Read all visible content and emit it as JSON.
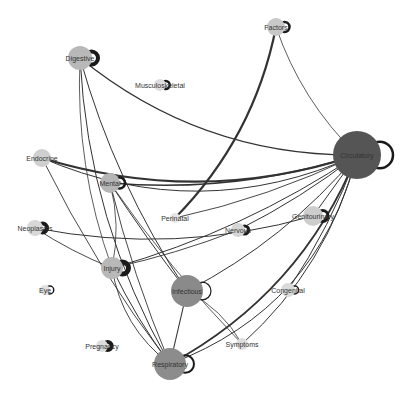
{
  "diagram": {
    "type": "network-graph",
    "colors": {
      "node_light": "#d3d3d3",
      "node_medium": "#b8b8b8",
      "node_large": "#8c8c8c",
      "node_hub": "#555555",
      "edge": "#333333",
      "label": "#333333"
    },
    "nodes": [
      {
        "id": "digestive",
        "label": "Digestive",
        "x": 80,
        "y": 58,
        "r": 12,
        "fill": "#b8b8b8",
        "loop": 4
      },
      {
        "id": "factors",
        "label": "Factors",
        "x": 276,
        "y": 27,
        "r": 9,
        "fill": "#c8c8c8",
        "loop": 2.5
      },
      {
        "id": "musculoskeletal",
        "label": "Musculoskeletal",
        "x": 160,
        "y": 85,
        "r": 6,
        "fill": "#dddddd",
        "loop": 2.5
      },
      {
        "id": "circulatory",
        "label": "Circulatory",
        "x": 357,
        "y": 155,
        "r": 24,
        "fill": "#555555",
        "loop": 2.5
      },
      {
        "id": "endocrine",
        "label": "Endocrine",
        "x": 42,
        "y": 158,
        "r": 9,
        "fill": "#cfcfcf",
        "loop": 0
      },
      {
        "id": "mental",
        "label": "Mental",
        "x": 110,
        "y": 183,
        "r": 10,
        "fill": "#b5b5b5",
        "loop": 2.5
      },
      {
        "id": "perinatal",
        "label": "Perinatal",
        "x": 175,
        "y": 218,
        "r": 5,
        "fill": "#e6e6e6",
        "loop": 0
      },
      {
        "id": "neoplasms",
        "label": "Neoplasms",
        "x": 35,
        "y": 228,
        "r": 8,
        "fill": "#d8d8d8",
        "loop": 4
      },
      {
        "id": "nervous",
        "label": "Nervous",
        "x": 238,
        "y": 230,
        "r": 7,
        "fill": "#d5d5d5",
        "loop": 3
      },
      {
        "id": "genitourinary",
        "label": "Genitourinary",
        "x": 313,
        "y": 216,
        "r": 10,
        "fill": "#cdcdcd",
        "loop": 3
      },
      {
        "id": "injury",
        "label": "Injury",
        "x": 112,
        "y": 268,
        "r": 11,
        "fill": "#b8b8b8",
        "loop": 5
      },
      {
        "id": "infectious",
        "label": "Infectious",
        "x": 187,
        "y": 291,
        "r": 16,
        "fill": "#8a8a8a",
        "loop": 1.2
      },
      {
        "id": "eye",
        "label": "Eye",
        "x": 45,
        "y": 290,
        "r": 5,
        "fill": "#e0e0e0",
        "loop": 1.5
      },
      {
        "id": "congenital",
        "label": "Congenital",
        "x": 288,
        "y": 290,
        "r": 7,
        "fill": "#dadada",
        "loop": 1.5
      },
      {
        "id": "pregnancy",
        "label": "Pregnancy",
        "x": 102,
        "y": 346,
        "r": 6,
        "fill": "#dcdcdc",
        "loop": 4
      },
      {
        "id": "respiratory",
        "label": "Respiratory",
        "x": 170,
        "y": 364,
        "r": 16,
        "fill": "#8c8c8c",
        "loop": 2
      },
      {
        "id": "symptoms",
        "label": "Symptoms",
        "x": 242,
        "y": 344,
        "r": 6,
        "fill": "#dddddd",
        "loop": 0
      }
    ],
    "edges": [
      {
        "source": "digestive",
        "target": "circulatory",
        "w": 1.2,
        "bend": 0.18
      },
      {
        "source": "digestive",
        "target": "respiratory",
        "w": 1.0,
        "bend": 0.12
      },
      {
        "source": "digestive",
        "target": "infectious",
        "w": 1.0,
        "bend": 0.08
      },
      {
        "source": "digestive",
        "target": "injury",
        "w": 0.8,
        "bend": 0.1
      },
      {
        "source": "factors",
        "target": "perinatal",
        "w": 2.2,
        "bend": -0.15
      },
      {
        "source": "factors",
        "target": "circulatory",
        "w": 0.8,
        "bend": 0.12
      },
      {
        "source": "endocrine",
        "target": "circulatory",
        "w": 2.2,
        "bend": 0.16
      },
      {
        "source": "endocrine",
        "target": "circulatory",
        "w": 1.0,
        "bend": 0.22
      },
      {
        "source": "endocrine",
        "target": "respiratory",
        "w": 0.9,
        "bend": 0.05
      },
      {
        "source": "mental",
        "target": "circulatory",
        "w": 1.6,
        "bend": 0.1
      },
      {
        "source": "mental",
        "target": "infectious",
        "w": 1.0,
        "bend": 0.02
      },
      {
        "source": "mental",
        "target": "respiratory",
        "w": 0.9,
        "bend": 0.04
      },
      {
        "source": "mental",
        "target": "symptoms",
        "w": 0.8,
        "bend": 0.04
      },
      {
        "source": "mental",
        "target": "injury",
        "w": 0.8,
        "bend": -0.12
      },
      {
        "source": "neoplasms",
        "target": "genitourinary",
        "w": 1.0,
        "bend": 0.12
      },
      {
        "source": "neoplasms",
        "target": "injury",
        "w": 0.9,
        "bend": 0.05
      },
      {
        "source": "injury",
        "target": "circulatory",
        "w": 1.0,
        "bend": 0.08
      },
      {
        "source": "injury",
        "target": "respiratory",
        "w": 1.0,
        "bend": 0.05
      },
      {
        "source": "injury",
        "target": "nervous",
        "w": 0.9,
        "bend": 0.04
      },
      {
        "source": "infectious",
        "target": "circulatory",
        "w": 1.0,
        "bend": 0.1
      },
      {
        "source": "infectious",
        "target": "respiratory",
        "w": 1.1,
        "bend": 0.0
      },
      {
        "source": "infectious",
        "target": "symptoms",
        "w": 0.8,
        "bend": -0.15
      },
      {
        "source": "respiratory",
        "target": "circulatory",
        "w": 2.0,
        "bend": 0.18
      },
      {
        "source": "respiratory",
        "target": "circulatory",
        "w": 1.0,
        "bend": 0.26
      },
      {
        "source": "respiratory",
        "target": "injury",
        "w": 0.9,
        "bend": -0.2
      },
      {
        "source": "nervous",
        "target": "circulatory",
        "w": 1.0,
        "bend": 0.05
      },
      {
        "source": "genitourinary",
        "target": "circulatory",
        "w": 1.0,
        "bend": 0.0
      },
      {
        "source": "congenital",
        "target": "circulatory",
        "w": 1.0,
        "bend": 0.06
      },
      {
        "source": "symptoms",
        "target": "circulatory",
        "w": 1.0,
        "bend": 0.15
      },
      {
        "source": "perinatal",
        "target": "circulatory",
        "w": 0.9,
        "bend": 0.06
      }
    ]
  }
}
